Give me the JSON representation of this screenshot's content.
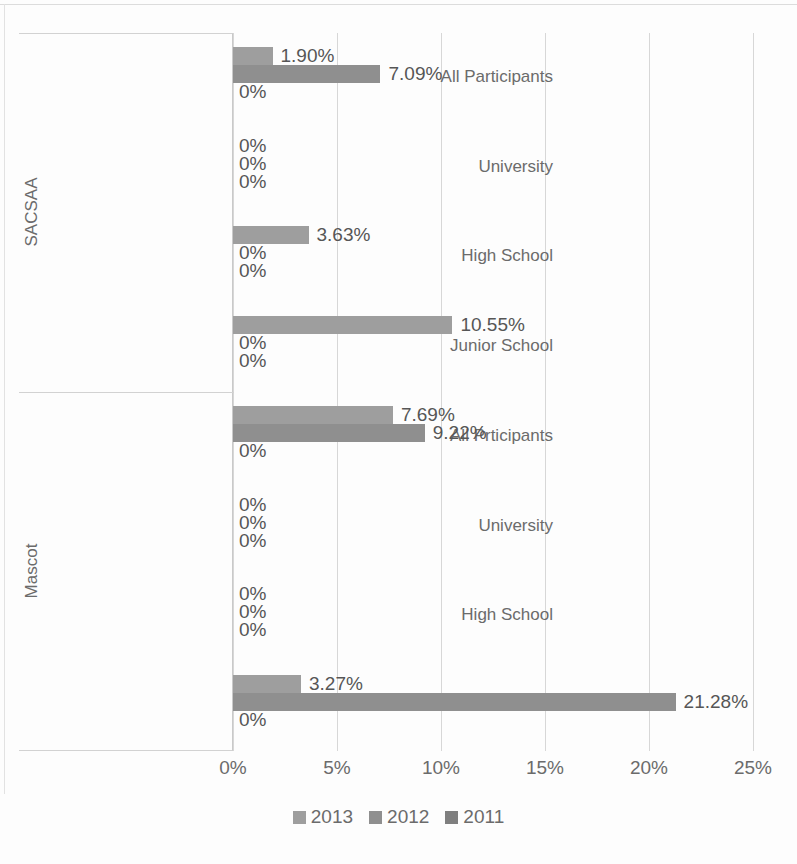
{
  "chart_data": {
    "type": "bar",
    "orientation": "horizontal",
    "title": "",
    "xlabel": "",
    "ylabel": "",
    "xlim": [
      0,
      25
    ],
    "xtick_labels": [
      "0%",
      "5%",
      "10%",
      "15%",
      "20%",
      "25%"
    ],
    "xticks": [
      0,
      5,
      10,
      15,
      20,
      25
    ],
    "grid": true,
    "legend_position": "bottom",
    "legend": [
      "2013",
      "2012",
      "2011"
    ],
    "series": [
      {
        "name": "2013",
        "color": "#9e9e9e"
      },
      {
        "name": "2012",
        "color": "#8f8f8f"
      },
      {
        "name": "2011",
        "color": "#7f7f7f"
      }
    ],
    "groups": [
      {
        "name": "SACSAA",
        "categories": [
          {
            "label": "All Participants",
            "values": [
              1.9,
              7.09,
              0
            ],
            "labels": [
              "1.90%",
              "7.09%",
              "0%"
            ]
          },
          {
            "label": "University",
            "values": [
              0,
              0,
              0
            ],
            "labels": [
              "0%",
              "0%",
              "0%"
            ]
          },
          {
            "label": "High School",
            "values": [
              3.63,
              0,
              0
            ],
            "labels": [
              "3.63%",
              "0%",
              "0%"
            ]
          },
          {
            "label": "Junior School",
            "values": [
              10.55,
              0,
              0
            ],
            "labels": [
              "10.55%",
              "0%",
              "0%"
            ]
          }
        ]
      },
      {
        "name": "Mascot",
        "categories": [
          {
            "label": "All Prticipants",
            "values": [
              7.69,
              9.22,
              0
            ],
            "labels": [
              "7.69%",
              "9.22%",
              "0%"
            ]
          },
          {
            "label": "University",
            "values": [
              0,
              0,
              0
            ],
            "labels": [
              "0%",
              "0%",
              "0%"
            ]
          },
          {
            "label": "High School",
            "values": [
              0,
              0,
              0
            ],
            "labels": [
              "0%",
              "0%",
              "0%"
            ]
          },
          {
            "label": "Junior School",
            "values": [
              3.27,
              21.28,
              0
            ],
            "labels": [
              "3.27%",
              "21.28%",
              "0%"
            ]
          }
        ]
      }
    ]
  }
}
